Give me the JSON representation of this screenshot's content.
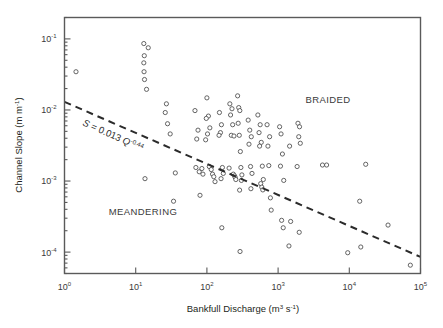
{
  "figure": {
    "background_color": "#ffffff",
    "frame_color": "#5a5a5a",
    "marker_stroke_color": "#4a4a4a",
    "trendline_color": "#2b2b2b"
  },
  "chart_data": {
    "type": "scatter",
    "title": "",
    "xlabel": "Bankfull Discharge (m3 s-1)",
    "xlabel_parts": {
      "text": "Bankfull Discharge (m",
      "sup1": "3",
      "mid": " s",
      "sup2": "-1",
      "tail": ")"
    },
    "ylabel": "Channel Slope (m m-1)",
    "ylabel_parts": {
      "text": "Channel Slope (m m",
      "sup1": "-1",
      "tail": ")"
    },
    "xscale": "log",
    "yscale": "log",
    "xlim": [
      1,
      100000
    ],
    "ylim": [
      5e-05,
      0.2
    ],
    "grid": false,
    "legend": "none",
    "xticks": [
      1,
      10,
      100,
      1000,
      10000,
      100000
    ],
    "xtick_labels": [
      "10^0",
      "10^1",
      "10^2",
      "10^3",
      "10^4",
      "10^5"
    ],
    "xtick_mantissas": [
      "10",
      "10",
      "10",
      "10",
      "10",
      "10"
    ],
    "xtick_exponents": [
      "0",
      "1",
      "2",
      "3",
      "4",
      "5"
    ],
    "yticks": [
      0.1,
      0.01,
      0.001,
      0.0001
    ],
    "ytick_labels": [
      "10^-1",
      "10^-2",
      "10^-3",
      "10^-4"
    ],
    "ytick_mantissas": [
      "10",
      "10",
      "10",
      "10"
    ],
    "ytick_exponents": [
      "-1",
      "-2",
      "-3",
      "-4"
    ],
    "annotations": [
      {
        "name": "braided-label",
        "text": "BRAIDED",
        "x": 6000,
        "y": 0.013
      },
      {
        "name": "meandering-label",
        "text": "MEANDERING",
        "x": 33,
        "y": 0.00028
      },
      {
        "name": "equation-label",
        "text": "S = 0.013 Q-0.44",
        "x": 12,
        "y": 0.0032
      }
    ],
    "equation": {
      "symbol": "S",
      "equals": " = 0.013 ",
      "base": "Q",
      "exponent": "-0.44",
      "full": "S = 0.013 Q^-0.44",
      "coefficient": 0.013,
      "power": -0.44
    },
    "trendline": {
      "name": "threshold-line",
      "style": "dashed",
      "formula": "S = 0.013 * Q^-0.44",
      "x_start": 1.0,
      "y_start": 0.013,
      "x_end": 100000,
      "y_end": 8.55e-05
    },
    "series": [
      {
        "name": "river-reaches",
        "marker": "open-circle",
        "points": [
          [
            1.45,
            0.0345
          ],
          [
            13.0,
            0.086
          ],
          [
            15.0,
            0.075
          ],
          [
            13.2,
            0.058
          ],
          [
            13.0,
            0.046
          ],
          [
            13.1,
            0.0345
          ],
          [
            13.3,
            0.0268
          ],
          [
            14.2,
            0.0195
          ],
          [
            13.5,
            0.00108
          ],
          [
            27.0,
            0.0122
          ],
          [
            26.0,
            0.0092
          ],
          [
            28.0,
            0.0064
          ],
          [
            30.5,
            0.0046
          ],
          [
            36.0,
            0.0013
          ],
          [
            34.0,
            0.00052
          ],
          [
            68.0,
            0.0098
          ],
          [
            75.0,
            0.0052
          ],
          [
            72.0,
            0.0039
          ],
          [
            70.0,
            0.00155
          ],
          [
            78.0,
            0.00135
          ],
          [
            85.0,
            0.0015
          ],
          [
            88.0,
            0.00125
          ],
          [
            80.0,
            0.00063
          ],
          [
            100.0,
            0.0148
          ],
          [
            105.0,
            0.0082
          ],
          [
            98.0,
            0.0076
          ],
          [
            110.0,
            0.0056
          ],
          [
            102.0,
            0.0046
          ],
          [
            96.0,
            0.0038
          ],
          [
            108.0,
            0.0016
          ],
          [
            115.0,
            0.00145
          ],
          [
            120.0,
            0.00125
          ],
          [
            125.0,
            0.00115
          ],
          [
            130.0,
            0.00098
          ],
          [
            150.0,
            0.0092
          ],
          [
            160.0,
            0.0062
          ],
          [
            155.0,
            0.0048
          ],
          [
            148.0,
            0.0044
          ],
          [
            165.0,
            0.00155
          ],
          [
            170.0,
            0.00128
          ],
          [
            158.0,
            0.00108
          ],
          [
            162.0,
            0.00022
          ],
          [
            210.0,
            0.0122
          ],
          [
            225.0,
            0.0104
          ],
          [
            215.0,
            0.0085
          ],
          [
            230.0,
            0.0062
          ],
          [
            220.0,
            0.0044
          ],
          [
            240.0,
            0.0043
          ],
          [
            205.0,
            0.00152
          ],
          [
            235.0,
            0.00125
          ],
          [
            245.0,
            0.00118
          ],
          [
            250.0,
            0.00112
          ],
          [
            255.0,
            0.00105
          ],
          [
            270.0,
            0.0158
          ],
          [
            280.0,
            0.0108
          ],
          [
            290.0,
            0.0098
          ],
          [
            275.0,
            0.0065
          ],
          [
            285.0,
            0.0044
          ],
          [
            295.0,
            0.0026
          ],
          [
            300.0,
            0.00155
          ],
          [
            310.0,
            0.00122
          ],
          [
            305.0,
            0.00102
          ],
          [
            288.0,
            0.000745
          ],
          [
            292.0,
            0.000102
          ],
          [
            380.0,
            0.0072
          ],
          [
            400.0,
            0.0052
          ],
          [
            420.0,
            0.0042
          ],
          [
            390.0,
            0.0033
          ],
          [
            410.0,
            0.0016
          ],
          [
            430.0,
            0.00128
          ],
          [
            415.0,
            0.00078
          ],
          [
            520.0,
            0.0085
          ],
          [
            560.0,
            0.0062
          ],
          [
            540.0,
            0.0048
          ],
          [
            580.0,
            0.0035
          ],
          [
            550.0,
            0.0031
          ],
          [
            600.0,
            0.00162
          ],
          [
            620.0,
            0.00105
          ],
          [
            570.0,
            0.00092
          ],
          [
            590.0,
            0.00082
          ],
          [
            610.0,
            0.00075
          ],
          [
            700.0,
            0.0062
          ],
          [
            760.0,
            0.0042
          ],
          [
            720.0,
            0.0031
          ],
          [
            740.0,
            0.00165
          ],
          [
            780.0,
            0.00058
          ],
          [
            800.0,
            0.00039
          ],
          [
            1050.0,
            0.0058
          ],
          [
            1100.0,
            0.0046
          ],
          [
            1150.0,
            0.0024
          ],
          [
            1080.0,
            0.00162
          ],
          [
            1200.0,
            0.00102
          ],
          [
            1120.0,
            0.00028
          ],
          [
            1180.0,
            0.00022
          ],
          [
            1450.0,
            0.0031
          ],
          [
            1500.0,
            0.00027
          ],
          [
            1420.0,
            0.000122
          ],
          [
            1900.0,
            0.0065
          ],
          [
            2000.0,
            0.0058
          ],
          [
            1950.0,
            0.0042
          ],
          [
            2050.0,
            0.0034
          ],
          [
            1850.0,
            0.0016
          ],
          [
            1980.0,
            0.00019
          ],
          [
            4200.0,
            0.00168
          ],
          [
            4800.0,
            0.00168
          ],
          [
            9500.0,
            9.8e-05
          ],
          [
            14000.0,
            0.00052
          ],
          [
            14500.0,
            0.000118
          ],
          [
            17000.0,
            0.00172
          ],
          [
            35000.0,
            0.00024
          ],
          [
            72000.0,
            6.55e-05
          ]
        ]
      }
    ]
  }
}
